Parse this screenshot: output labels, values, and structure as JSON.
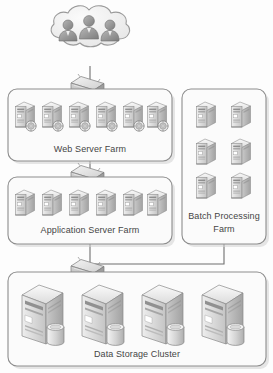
{
  "diagram": {
    "background_color": "#fdfdfd",
    "line_color": "#6f6f6f",
    "box_fill": "#fbfbfb",
    "box_stroke": "#8d8d8d",
    "label_color": "#454545",
    "server_light": "#f2f2f2",
    "server_mid": "#c9c9c9",
    "server_dark": "#9a9a9a"
  },
  "cloud": {
    "name": "user-cloud",
    "label": "",
    "user_count": 3,
    "fill": "#f0f0f0",
    "stroke": "#9a9a9a"
  },
  "zones": [
    {
      "id": "web-server-farm",
      "label": "Web Server Farm",
      "server_count": 6,
      "server_type": "web-server",
      "x": 8,
      "y": 89,
      "w": 164,
      "h": 72
    },
    {
      "id": "application-server-farm",
      "label": "Application Server Farm",
      "server_count": 6,
      "server_type": "app-server",
      "x": 8,
      "y": 177,
      "w": 164,
      "h": 67
    },
    {
      "id": "batch-processing-farm",
      "label": "Batch Processing Farm",
      "label_line1": "Batch Processing",
      "label_line2": "Farm",
      "server_count": 6,
      "server_type": "batch-server",
      "x": 182,
      "y": 89,
      "w": 84,
      "h": 155
    },
    {
      "id": "data-storage-cluster",
      "label": "Data Storage Cluster",
      "server_count": 4,
      "server_type": "storage-server",
      "x": 8,
      "y": 272,
      "w": 258,
      "h": 94
    }
  ],
  "switches": [
    {
      "id": "switch-cloud-to-web",
      "label": "network-switch",
      "x": 71,
      "y": 74
    },
    {
      "id": "switch-web-to-app",
      "label": "network-switch",
      "x": 71,
      "y": 163
    },
    {
      "id": "switch-app-to-storage",
      "label": "network-switch",
      "x": 71,
      "y": 257
    }
  ],
  "connections": [
    {
      "from": "user-cloud",
      "to": "web-server-farm"
    },
    {
      "from": "web-server-farm",
      "to": "application-server-farm"
    },
    {
      "from": "application-server-farm",
      "to": "data-storage-cluster"
    },
    {
      "from": "batch-processing-farm",
      "to": "data-storage-cluster"
    }
  ]
}
